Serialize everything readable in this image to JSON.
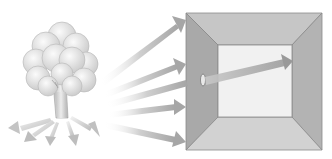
{
  "diagram": {
    "title": "",
    "colors": {
      "background": "#ffffff",
      "box_outer_top": "#c4c4c4",
      "box_left_wall": "#a8a8a8",
      "box_right_wall": "#b0b0b0",
      "box_bottom": "#cfcfcf",
      "box_back": "#efefef",
      "arrow": "#a9a9a9",
      "tree_canopy": "#dcdcdc",
      "tree_trunk": "#cfcfcf"
    },
    "nodes": [
      {
        "id": "tree",
        "label": ""
      },
      {
        "id": "box",
        "label": ""
      },
      {
        "id": "hole",
        "label": ""
      }
    ]
  }
}
